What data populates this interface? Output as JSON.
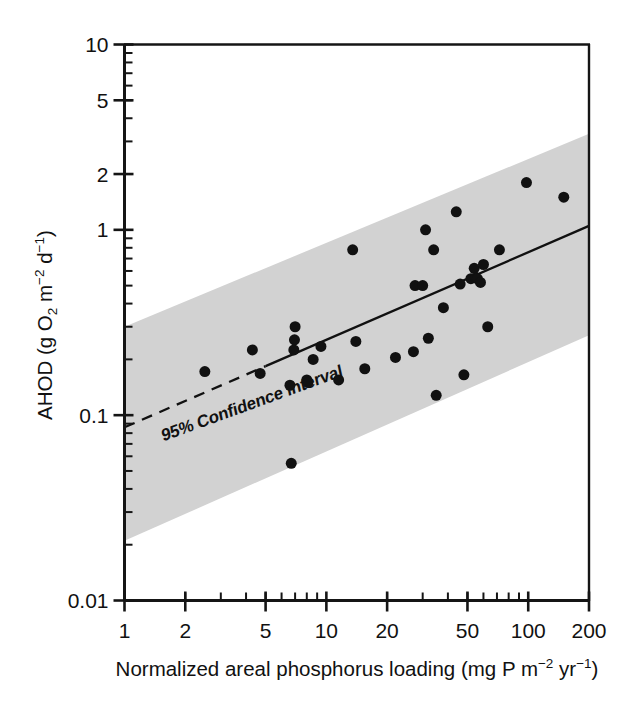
{
  "figure": {
    "background_color": "#ffffff",
    "ink_color": "#111111",
    "band_color": "#d2d2d2"
  },
  "chart_data": {
    "type": "scatter",
    "title": "",
    "xlabel_plain": "Normalized areal phosphorus loading (mg P m-2 yr-1)",
    "xlabel_parts": {
      "main": "Normalized areal phosphorus loading (mg P m",
      "sup1": "−2",
      "mid": " yr",
      "sup2": "−1",
      "tail": ")"
    },
    "ylabel_plain": "AHOD (g O2 m-2 d-1)",
    "ylabel_parts": {
      "lead": "AHOD (g O",
      "sub1": "2",
      "mid": " m",
      "sup1": "−2",
      "mid2": " d",
      "sup2": "−1",
      "tail": ")"
    },
    "xscale": "log",
    "yscale": "log",
    "xlim": [
      1,
      200
    ],
    "ylim": [
      0.01,
      10
    ],
    "xticks": [
      1,
      2,
      5,
      10,
      20,
      50,
      100,
      200
    ],
    "xtick_labels": [
      "1",
      "2",
      "5",
      "10",
      "20",
      "50",
      "100",
      "200"
    ],
    "yticks": [
      0.01,
      0.1,
      1,
      2,
      5,
      10
    ],
    "ytick_labels": [
      "0.01",
      "0.1",
      "1",
      "2",
      "5",
      "10"
    ],
    "grid": false,
    "legend_position": "none",
    "annotations": [
      {
        "text": "95% Confidence interval",
        "x": 1.55,
        "y": 0.072,
        "rotation_deg": -20,
        "style": "bold-condensed-italic-slant"
      }
    ],
    "series": [
      {
        "name": "Lake observations",
        "type": "scatter",
        "marker": "filled-circle",
        "marker_color": "#111111",
        "marker_size_px": 11,
        "points": [
          [
            2.5,
            0.172
          ],
          [
            4.3,
            0.225
          ],
          [
            4.7,
            0.168
          ],
          [
            6.6,
            0.145
          ],
          [
            6.7,
            0.055
          ],
          [
            6.9,
            0.225
          ],
          [
            6.95,
            0.255
          ],
          [
            7.0,
            0.3
          ],
          [
            8.0,
            0.155
          ],
          [
            8.1,
            0.15
          ],
          [
            8.6,
            0.2
          ],
          [
            9.4,
            0.235
          ],
          [
            11.5,
            0.155
          ],
          [
            13.5,
            0.78
          ],
          [
            14.0,
            0.25
          ],
          [
            15.5,
            0.178
          ],
          [
            22.0,
            0.205
          ],
          [
            27.0,
            0.22
          ],
          [
            27.5,
            0.5
          ],
          [
            30.0,
            0.5
          ],
          [
            31.0,
            1.0
          ],
          [
            32.0,
            0.26
          ],
          [
            34.0,
            0.78
          ],
          [
            35.0,
            0.128
          ],
          [
            38.0,
            0.38
          ],
          [
            44.0,
            1.25
          ],
          [
            46.0,
            0.51
          ],
          [
            48.0,
            0.165
          ],
          [
            52.0,
            0.545
          ],
          [
            54.0,
            0.62
          ],
          [
            55.0,
            0.55
          ],
          [
            56.0,
            0.545
          ],
          [
            58.0,
            0.52
          ],
          [
            60.0,
            0.65
          ],
          [
            63.0,
            0.3
          ],
          [
            72.0,
            0.78
          ],
          [
            98.0,
            1.8
          ],
          [
            150.0,
            1.5
          ]
        ]
      }
    ],
    "fit_line": {
      "name": "Regression line",
      "style": "solid",
      "color": "#111111",
      "dashed_segment": {
        "x_from": 1,
        "x_to": 5.0,
        "note": "extrapolated portion drawn dashed"
      },
      "endpoints": [
        [
          1,
          0.086
        ],
        [
          200,
          1.05
        ]
      ]
    },
    "confidence_band": {
      "name": "95% Confidence interval",
      "level": 95,
      "fill_color": "#d2d2d2",
      "lower_endpoints": [
        [
          1,
          0.021
        ],
        [
          200,
          0.27
        ]
      ],
      "upper_endpoints": [
        [
          1,
          0.3
        ],
        [
          200,
          3.3
        ]
      ]
    }
  }
}
